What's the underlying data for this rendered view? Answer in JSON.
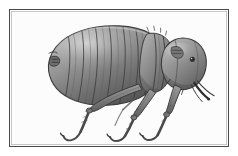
{
  "figure": {
    "subject": "flea",
    "subject_label": "Flea (Siphonaptera), lateral view",
    "style": "grayscale engraving illustration",
    "orientation": "head facing right, abdomen to the left",
    "frame": {
      "border_color": "#4a4a4a",
      "inner_border_color": "#c8c8c8",
      "background_color": "#fcfcfc",
      "x": 9,
      "y": 9,
      "width": 220,
      "height": 138
    },
    "page_background_color": "#ffffff",
    "palette": {
      "outline": "#3a3a3a",
      "body_dark": "#5d5d5d",
      "body_mid": "#8a8a8a",
      "body_light": "#b4b4b4",
      "highlight": "#d8d8d8",
      "leg_stroke": "#4d4d4d",
      "shadow": "#444444"
    },
    "anatomy": {
      "abdomen_segments": 9,
      "leg_pairs": 3,
      "leg_names": [
        "foreleg",
        "midleg",
        "hindleg"
      ],
      "head_features": [
        "eye",
        "antenna",
        "proboscis",
        "genal comb"
      ],
      "bristles": true
    }
  }
}
